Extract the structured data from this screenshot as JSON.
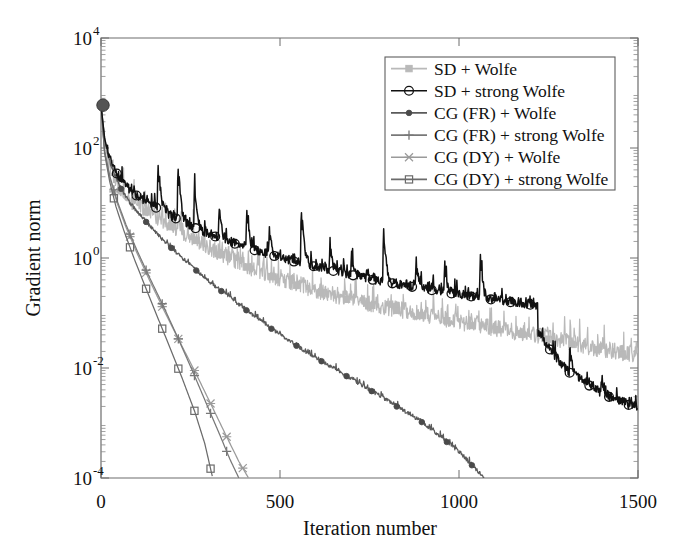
{
  "chart_data": {
    "type": "line",
    "title": "",
    "xlabel": "Iteration number",
    "ylabel": "Gradient norm",
    "xlim": [
      0,
      1500
    ],
    "ylim": [
      0.0001,
      10000
    ],
    "yscale": "log",
    "xscale": "linear",
    "grid": false,
    "legend_position": "upper right",
    "xticks": [
      0,
      500,
      1000,
      1500
    ],
    "xticklabels": [
      "0",
      "500",
      "1000",
      "1500"
    ],
    "yticks": [
      0.0001,
      0.01,
      1,
      100,
      10000
    ],
    "yticklabels": [
      "10-4",
      "10-2",
      "100",
      "102",
      "104"
    ],
    "ytick_mantissa": "10",
    "ytick_exponents": [
      "-4",
      "-2",
      "0",
      "2",
      "4"
    ],
    "start_marker": {
      "x": 0,
      "y": 600,
      "label": "initial-gradient-norm"
    },
    "series": [
      {
        "name": "SD + Wolfe",
        "color": "#b9b9b9",
        "marker": "square-filled",
        "marker_color": "#b9b9b9",
        "noisy": true,
        "noise_amp": 0.55,
        "spiky": false,
        "x": [
          0,
          10,
          20,
          35,
          55,
          80,
          110,
          150,
          200,
          260,
          330,
          420,
          520,
          630,
          750,
          880,
          1000,
          1120,
          1250,
          1380,
          1500
        ],
        "y": [
          600,
          130,
          60,
          30,
          17,
          11,
          8.0,
          5.5,
          3.6,
          2.2,
          1.2,
          0.62,
          0.36,
          0.22,
          0.14,
          0.095,
          0.065,
          0.048,
          0.033,
          0.022,
          0.016
        ]
      },
      {
        "name": "SD + strong Wolfe",
        "color": "#111111",
        "marker": "circle-open",
        "marker_color": "#111111",
        "noisy": true,
        "noise_amp": 0.3,
        "spiky": true,
        "spikes": [
          {
            "x": 160,
            "mag": 7.0
          },
          {
            "x": 215,
            "mag": 9.0
          },
          {
            "x": 262,
            "mag": 6.0
          },
          {
            "x": 330,
            "mag": 3.5
          },
          {
            "x": 408,
            "mag": 5.0
          },
          {
            "x": 470,
            "mag": 3.0
          },
          {
            "x": 560,
            "mag": 9.0
          },
          {
            "x": 640,
            "mag": 3.0
          },
          {
            "x": 700,
            "mag": 2.6
          },
          {
            "x": 790,
            "mag": 8.0
          },
          {
            "x": 880,
            "mag": 3.2
          },
          {
            "x": 960,
            "mag": 3.0
          },
          {
            "x": 1060,
            "mag": 5.0
          },
          {
            "x": 1310,
            "mag": 3.0
          },
          {
            "x": 1400,
            "mag": 2.0
          }
        ],
        "drops": [
          {
            "x": 1220,
            "factor": 0.28
          }
        ],
        "x": [
          0,
          10,
          22,
          40,
          62,
          90,
          125,
          170,
          225,
          290,
          365,
          450,
          545,
          650,
          760,
          880,
          1000,
          1120,
          1225,
          1300,
          1400,
          1500
        ],
        "y": [
          600,
          150,
          72,
          38,
          22,
          15,
          10.5,
          7.2,
          4.6,
          2.9,
          1.9,
          1.25,
          0.84,
          0.58,
          0.4,
          0.29,
          0.215,
          0.165,
          0.135,
          0.032,
          0.012,
          0.0065
        ]
      },
      {
        "name": "CG (FR) + Wolfe",
        "color": "#5a5a5a",
        "marker": "dot-filled",
        "marker_color": "#4a4a4a",
        "noisy": true,
        "noise_amp": 0.12,
        "spiky": false,
        "x": [
          0,
          12,
          28,
          50,
          80,
          120,
          170,
          230,
          300,
          380,
          470,
          570,
          680,
          790,
          900,
          1000,
          1070
        ],
        "y": [
          600,
          120,
          48,
          21,
          10,
          5.0,
          2.2,
          0.95,
          0.38,
          0.15,
          0.055,
          0.02,
          0.0075,
          0.0028,
          0.001,
          0.0003,
          0.0001
        ]
      },
      {
        "name": "CG (FR) + strong Wolfe",
        "color": "#787878",
        "marker": "plus",
        "marker_color": "#787878",
        "noisy": false,
        "noise_amp": 0.0,
        "spiky": false,
        "x": [
          0,
          10,
          25,
          45,
          70,
          100,
          135,
          175,
          215,
          255,
          295,
          330,
          360,
          385
        ],
        "y": [
          600,
          90,
          30,
          11,
          4.0,
          1.4,
          0.45,
          0.13,
          0.035,
          0.009,
          0.0022,
          0.00065,
          0.00022,
          0.0001
        ]
      },
      {
        "name": "CG (DY) + Wolfe",
        "color": "#9a9a9a",
        "marker": "x-cross",
        "marker_color": "#9a9a9a",
        "noisy": false,
        "noise_amp": 0.0,
        "spiky": false,
        "x": [
          0,
          10,
          25,
          45,
          70,
          100,
          135,
          175,
          220,
          265,
          310,
          350,
          385,
          412
        ],
        "y": [
          600,
          85,
          28,
          10,
          3.6,
          1.25,
          0.4,
          0.115,
          0.03,
          0.008,
          0.002,
          0.00058,
          0.0002,
          0.0001
        ]
      },
      {
        "name": "CG (DY) + strong Wolfe",
        "color": "#6b6b6b",
        "marker": "square-open",
        "marker_color": "#6b6b6b",
        "noisy": false,
        "noise_amp": 0.0,
        "spiky": false,
        "x": [
          0,
          10,
          24,
          42,
          65,
          92,
          122,
          156,
          192,
          228,
          262,
          290,
          312
        ],
        "y": [
          600,
          80,
          25,
          8.5,
          3.0,
          1.0,
          0.32,
          0.09,
          0.024,
          0.0062,
          0.0016,
          0.00042,
          0.0001
        ]
      }
    ],
    "legend_entries": [
      "SD + Wolfe",
      "SD + strong Wolfe",
      "CG (FR) + Wolfe",
      "CG (FR) + strong Wolfe",
      "CG (DY) + Wolfe",
      "CG (DY) + strong Wolfe"
    ]
  }
}
